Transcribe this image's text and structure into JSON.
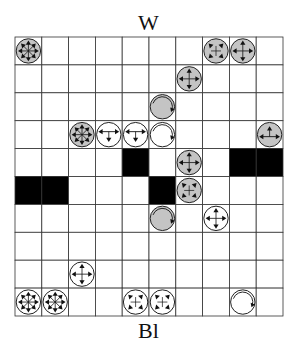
{
  "labels": {
    "top": "W",
    "bottom": "Bl"
  },
  "board": {
    "rows": 10,
    "cols": 10,
    "origin": {
      "x": 15,
      "y": 37
    },
    "cell": {
      "w": 26.8,
      "h": 27.9
    },
    "colors": {
      "line": "#333333",
      "blocked": "#000000",
      "grey_piece": "#c4c4c4",
      "white_piece": "#ffffff",
      "arrow": "#111111"
    },
    "blocked": [
      [
        4,
        4
      ],
      [
        4,
        8
      ],
      [
        4,
        9
      ],
      [
        5,
        0
      ],
      [
        5,
        1
      ],
      [
        5,
        5
      ]
    ],
    "pieces": [
      {
        "row": 0,
        "col": 0,
        "side": "grey",
        "type": "star"
      },
      {
        "row": 0,
        "col": 7,
        "side": "grey",
        "type": "diagonal"
      },
      {
        "row": 0,
        "col": 8,
        "side": "grey",
        "type": "orthogonal"
      },
      {
        "row": 1,
        "col": 6,
        "side": "grey",
        "type": "orthogonal"
      },
      {
        "row": 2,
        "col": 5,
        "side": "grey",
        "type": "rotator"
      },
      {
        "row": 3,
        "col": 2,
        "side": "grey",
        "type": "star"
      },
      {
        "row": 3,
        "col": 3,
        "side": "white",
        "type": "t-down"
      },
      {
        "row": 3,
        "col": 4,
        "side": "white",
        "type": "t-down"
      },
      {
        "row": 3,
        "col": 5,
        "side": "white",
        "type": "rotator"
      },
      {
        "row": 3,
        "col": 9,
        "side": "grey",
        "type": "t-up"
      },
      {
        "row": 4,
        "col": 6,
        "side": "grey",
        "type": "orthogonal"
      },
      {
        "row": 5,
        "col": 6,
        "side": "grey",
        "type": "diagonal"
      },
      {
        "row": 6,
        "col": 5,
        "side": "grey",
        "type": "rotator"
      },
      {
        "row": 6,
        "col": 7,
        "side": "white",
        "type": "orthogonal"
      },
      {
        "row": 8,
        "col": 2,
        "side": "white",
        "type": "orthogonal"
      },
      {
        "row": 9,
        "col": 0,
        "side": "white",
        "type": "star"
      },
      {
        "row": 9,
        "col": 1,
        "side": "white",
        "type": "star"
      },
      {
        "row": 9,
        "col": 4,
        "side": "white",
        "type": "diagonal"
      },
      {
        "row": 9,
        "col": 5,
        "side": "white",
        "type": "diagonal"
      },
      {
        "row": 9,
        "col": 8,
        "side": "white",
        "type": "rotator"
      }
    ]
  }
}
